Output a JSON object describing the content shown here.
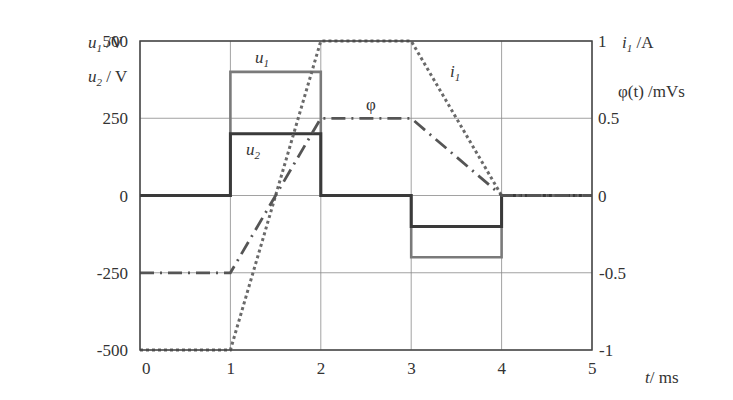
{
  "chart_data": {
    "type": "line",
    "title": "",
    "xlabel": "t/ ms",
    "ylabel_left": [
      "u1 /V",
      "u2 / V"
    ],
    "ylabel_right": [
      "i1 /A",
      "φ(t) /mVs"
    ],
    "xlim": [
      0,
      5
    ],
    "ylim_left": [
      -500,
      500
    ],
    "ylim_right": [
      -1,
      1
    ],
    "x_ticks": [
      "0",
      "1",
      "2",
      "3",
      "4",
      "5"
    ],
    "y_ticks_left": [
      "500",
      "250",
      "0",
      "-250",
      "-500"
    ],
    "y_ticks_right": [
      "1",
      "0.5",
      "0",
      "-0.5",
      "-1"
    ],
    "grid": true,
    "series": [
      {
        "name": "u1",
        "axis": "left",
        "style": "solid",
        "color": "#7a7a7a",
        "x": [
          0,
          1,
          1,
          2,
          2,
          3,
          3,
          4,
          4,
          5
        ],
        "y": [
          0,
          0,
          400,
          400,
          0,
          0,
          -200,
          -200,
          0,
          0
        ]
      },
      {
        "name": "u2",
        "axis": "left",
        "style": "solid",
        "color": "#3a3a3a",
        "x": [
          0,
          1,
          1,
          2,
          2,
          3,
          3,
          4,
          4,
          5
        ],
        "y": [
          0,
          0,
          200,
          200,
          0,
          0,
          -100,
          -100,
          0,
          0
        ]
      },
      {
        "name": "i1",
        "axis": "right",
        "style": "dotted",
        "color": "#6a6a6a",
        "x": [
          0,
          1,
          2,
          3,
          4,
          5
        ],
        "y": [
          -1,
          -1,
          1,
          1,
          0,
          0
        ]
      },
      {
        "name": "φ",
        "axis": "right",
        "style": "dash-dot",
        "color": "#555555",
        "x": [
          0,
          1,
          2,
          3,
          4,
          5
        ],
        "y": [
          -0.5,
          -0.5,
          0.5,
          0.5,
          0,
          0
        ]
      }
    ],
    "annotations": [
      {
        "text": "u1",
        "x": 1.4,
        "y": 450,
        "axis": "left"
      },
      {
        "text": "u2",
        "x": 1.2,
        "y": 155,
        "axis": "left"
      },
      {
        "text": "φ",
        "x": 2.6,
        "y": 0.56,
        "axis": "right"
      },
      {
        "text": "i1",
        "x": 3.4,
        "y": 0.88,
        "axis": "right"
      }
    ]
  },
  "labels": {
    "u1_axis": "u",
    "u1_sub": "1",
    "u1_unit": " /V",
    "u2_axis": "u",
    "u2_sub": "2",
    "u2_unit": " / V",
    "i1_axis": "i",
    "i1_sub": "1",
    "i1_unit": " /A",
    "phi_axis": "φ(t) /mVs",
    "t_axis": "t",
    "t_unit": "/ ms",
    "ann_u1": "u",
    "ann_u1_sub": "1",
    "ann_u2": "u",
    "ann_u2_sub": "2",
    "ann_phi": "φ",
    "ann_i1": "i",
    "ann_i1_sub": "1"
  }
}
